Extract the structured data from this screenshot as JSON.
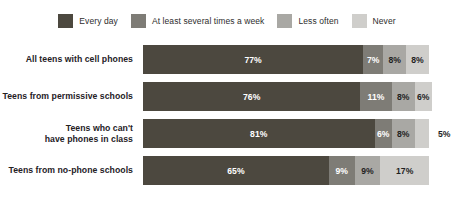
{
  "legend": {
    "items": [
      {
        "label": "Every day",
        "color": "#4c483f",
        "swatch_icon": "legend-swatch-every-day"
      },
      {
        "label": "At least several times a week",
        "color": "#7e7c76",
        "swatch_icon": "legend-swatch-several-times-week"
      },
      {
        "label": "Less often",
        "color": "#a9a8a4",
        "swatch_icon": "legend-swatch-less-often"
      },
      {
        "label": "Never",
        "color": "#cfcecb",
        "swatch_icon": "legend-swatch-never"
      }
    ]
  },
  "rows": [
    {
      "label_lines": [
        "All teens with cell phones"
      ],
      "values": [
        "77%",
        "7%",
        "8%",
        "8%"
      ]
    },
    {
      "label_lines": [
        "Teens from permissive schools"
      ],
      "values": [
        "76%",
        "11%",
        "8%",
        "6%"
      ]
    },
    {
      "label_lines": [
        "Teens who can't",
        "have phones in class"
      ],
      "values": [
        "81%",
        "6%",
        "8%",
        "5%"
      ]
    },
    {
      "label_lines": [
        "Teens from no-phone schools"
      ],
      "values": [
        "65%",
        "9%",
        "9%",
        "17%"
      ]
    }
  ],
  "chart_data": {
    "type": "bar",
    "orientation": "horizontal",
    "stacked": true,
    "normalized_percent": true,
    "title": "",
    "subtitle": "",
    "xlabel": "",
    "ylabel": "",
    "xlim": [
      0,
      100
    ],
    "grid": false,
    "legend_position": "top-center",
    "value_unit": "%",
    "categories": [
      "All teens with cell phones",
      "Teens from permissive schools",
      "Teens who can't have phones in class",
      "Teens from no-phone schools"
    ],
    "series": [
      {
        "name": "Every day",
        "color": "#4c483f",
        "values": [
          77,
          76,
          81,
          65
        ]
      },
      {
        "name": "At least several times a week",
        "color": "#7e7c76",
        "values": [
          7,
          11,
          6,
          9
        ]
      },
      {
        "name": "Less often",
        "color": "#a9a8a4",
        "values": [
          8,
          8,
          8,
          9
        ]
      },
      {
        "name": "Never",
        "color": "#cfcecb",
        "values": [
          8,
          6,
          5,
          17
        ]
      }
    ],
    "data_labels": [
      [
        "77%",
        "7%",
        "8%",
        "8%"
      ],
      [
        "76%",
        "11%",
        "8%",
        "6%"
      ],
      [
        "81%",
        "6%",
        "8%",
        "5%"
      ],
      [
        "65%",
        "9%",
        "9%",
        "17%"
      ]
    ],
    "annotations": [
      "Row 3 'Never' value label (5%) is rendered outside the bar to the right."
    ]
  }
}
